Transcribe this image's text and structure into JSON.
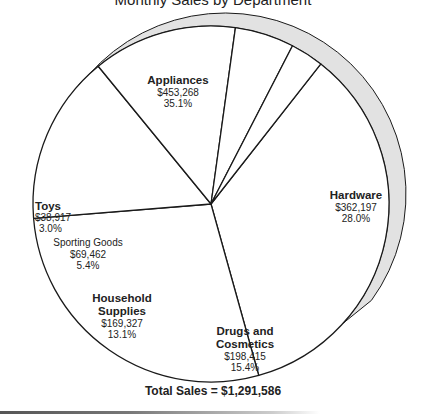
{
  "chart_data": {
    "type": "pie",
    "title": "Monthly Sales by Department",
    "categories": [
      "Appliances",
      "Hardware",
      "Drugs and Cosmetics",
      "Household Supplies",
      "Sporting Goods",
      "Toys"
    ],
    "values": [
      453268,
      362197,
      198415,
      169327,
      69462,
      38917
    ],
    "value_labels": [
      "$453,268",
      "$362,197",
      "$198,415",
      "$169,327",
      "$69,462",
      "$38,917"
    ],
    "percentages": [
      35.1,
      28.0,
      15.4,
      13.1,
      5.4,
      3.0
    ],
    "percent_labels": [
      "35.1%",
      "28.0%",
      "15.4%",
      "13.1%",
      "5.4%",
      "3.0%"
    ],
    "total_label": "Total Sales = $1,291,586",
    "total": 1291586,
    "slice_fill": "#ffffff",
    "shadow_fill": "#e2e2e2",
    "line_color": "#1a1a1a"
  },
  "labels": {
    "appliances": {
      "name": "Appliances",
      "value": "$453,268",
      "pct": "35.1%"
    },
    "hardware": {
      "name": "Hardware",
      "value": "$362,197",
      "pct": "28.0%"
    },
    "drugs": {
      "name_line1": "Drugs and",
      "name_line2": "Cosmetics",
      "value": "$198,415",
      "pct": "15.4%"
    },
    "household": {
      "name_line1": "Household",
      "name_line2": "Supplies",
      "value": "$169,327",
      "pct": "13.1%"
    },
    "sporting": {
      "name": "Sporting Goods",
      "value": "$69,462",
      "pct": "5.4%"
    },
    "toys": {
      "name": "Toys",
      "value": "$38,917",
      "pct": "3.0%"
    }
  }
}
